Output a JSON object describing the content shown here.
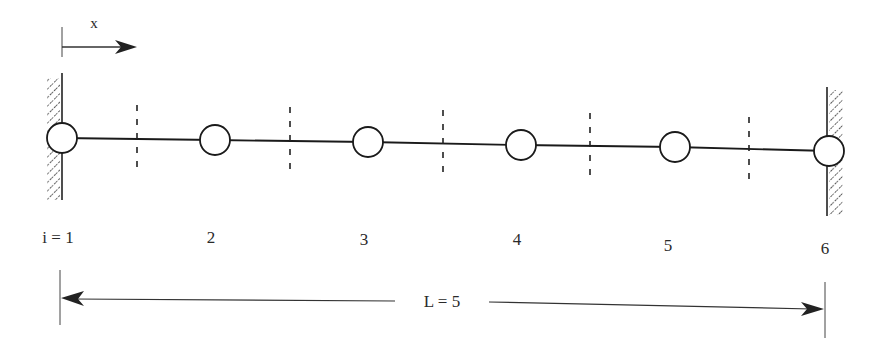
{
  "diagram": {
    "type": "1D finite-difference grid / fixed-fixed bar",
    "axis": {
      "label": "x",
      "direction": "right"
    },
    "index_prefix": "i = ",
    "nodes": [
      {
        "i": 1,
        "label": "i = 1",
        "cx": 62,
        "cy": 138,
        "label_x": 62
      },
      {
        "i": 2,
        "label": "2",
        "cx": 215,
        "cy": 140,
        "label_x": 211
      },
      {
        "i": 3,
        "label": "3",
        "cx": 368,
        "cy": 142,
        "label_x": 364
      },
      {
        "i": 4,
        "label": "4",
        "cx": 521,
        "cy": 145,
        "label_x": 517
      },
      {
        "i": 5,
        "label": "5",
        "cx": 675,
        "cy": 147,
        "label_x": 668
      },
      {
        "i": 6,
        "label": "6",
        "cx": 829,
        "cy": 151,
        "label_x": 825
      }
    ],
    "cell_boundaries_x": [
      137,
      290,
      443,
      590,
      749
    ],
    "supports": [
      {
        "name": "left-fixed-wall",
        "x": 62,
        "hatch_side": "left"
      },
      {
        "name": "right-fixed-wall",
        "x": 827,
        "hatch_side": "right"
      }
    ],
    "dimension": {
      "label": "L = 5",
      "from_x": 60,
      "to_x": 825
    },
    "colors": {
      "stroke": "#1a1a1a",
      "background": "#ffffff"
    }
  }
}
